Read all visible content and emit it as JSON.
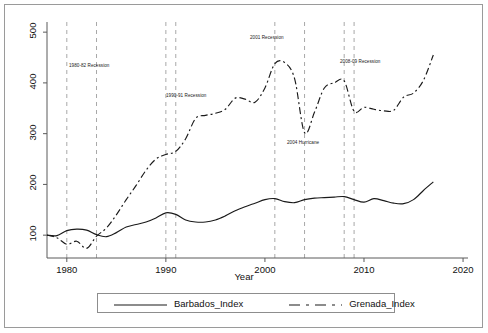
{
  "chart_data": {
    "type": "line",
    "title": "",
    "xlabel": "Year",
    "ylabel": "",
    "xlim": [
      1978,
      2020.5
    ],
    "ylim": [
      55,
      520
    ],
    "xticks": [
      1980,
      1990,
      2000,
      2010,
      2020
    ],
    "xtick_labels": [
      "1980",
      "1990",
      "2000",
      "2010",
      "2020"
    ],
    "yticks": [
      100,
      200,
      300,
      400,
      500
    ],
    "ytick_labels": [
      "100",
      "200",
      "300",
      "400",
      "500"
    ],
    "grid": false,
    "legend_position": "bottom",
    "series": [
      {
        "name": "Barbados_Index",
        "style": "solid",
        "color": "#1a1a1a",
        "x": [
          1978,
          1979,
          1980,
          1981,
          1982,
          1983,
          1984,
          1985,
          1986,
          1987,
          1988,
          1989,
          1990,
          1991,
          1992,
          1993,
          1994,
          1995,
          1996,
          1997,
          1998,
          1999,
          2000,
          2001,
          2002,
          2003,
          2004,
          2005,
          2006,
          2007,
          2008,
          2009,
          2010,
          2011,
          2012,
          2013,
          2014,
          2015,
          2016,
          2017
        ],
        "y": [
          100,
          99,
          109,
          112,
          110,
          101,
          97,
          105,
          116,
          121,
          126,
          134,
          144,
          141,
          130,
          126,
          126,
          130,
          138,
          148,
          156,
          163,
          170,
          172,
          166,
          164,
          170,
          173,
          174,
          175,
          176,
          170,
          165,
          172,
          168,
          163,
          162,
          170,
          188,
          205
        ]
      },
      {
        "name": "Grenada_Index",
        "style": "dashdot",
        "color": "#1a1a1a",
        "x": [
          1978,
          1979,
          1980,
          1981,
          1982,
          1983,
          1984,
          1985,
          1986,
          1987,
          1988,
          1989,
          1990,
          1991,
          1992,
          1993,
          1994,
          1995,
          1996,
          1997,
          1998,
          1999,
          2000,
          2001,
          2002,
          2003,
          2004,
          2005,
          2006,
          2007,
          2008,
          2009,
          2010,
          2011,
          2012,
          2013,
          2014,
          2015,
          2016,
          2017
        ],
        "y": [
          100,
          95,
          82,
          88,
          74,
          98,
          114,
          140,
          170,
          198,
          228,
          250,
          259,
          265,
          290,
          330,
          336,
          340,
          348,
          370,
          368,
          362,
          390,
          438,
          440,
          408,
          302,
          342,
          390,
          400,
          404,
          344,
          352,
          348,
          345,
          346,
          372,
          380,
          405,
          455
        ]
      }
    ],
    "event_lines": [
      {
        "year": 1980,
        "label": "",
        "style": "dashed"
      },
      {
        "year": 1983,
        "label": "",
        "style": "dashed"
      },
      {
        "year": 1990,
        "label": "",
        "style": "dashed"
      },
      {
        "year": 1991,
        "label": "",
        "style": "dashed"
      },
      {
        "year": 2001,
        "label": "",
        "style": "dashed"
      },
      {
        "year": 2004,
        "label": "",
        "style": "dashed"
      },
      {
        "year": 2008,
        "label": "",
        "style": "dashed"
      },
      {
        "year": 2009,
        "label": "",
        "style": "dashed"
      }
    ],
    "annotations": [
      {
        "text": "1980-82 Recession",
        "x": 69,
        "y": 63
      },
      {
        "text": "1990-91 Recession",
        "x": 166,
        "y": 93
      },
      {
        "text": "2001 Recession",
        "x": 250,
        "y": 35
      },
      {
        "text": "2004 Hurricane",
        "x": 287,
        "y": 140
      },
      {
        "text": "2008-09 Recession",
        "x": 340,
        "y": 59
      }
    ],
    "colors": {
      "line": "#1a1a1a",
      "event_line": "#a8a8a8",
      "axis": "#5a5a5a",
      "background": "#ffffff",
      "frame": "#9a9a9a"
    }
  },
  "legend": {
    "items": [
      {
        "label": "Barbados_Index",
        "style": "solid"
      },
      {
        "label": "Grenada_Index",
        "style": "dashdot"
      }
    ]
  }
}
